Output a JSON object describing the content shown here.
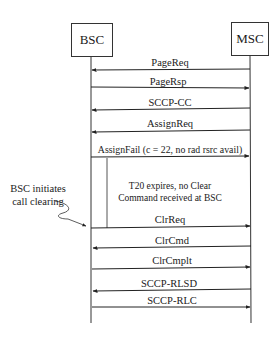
{
  "diagram": {
    "type": "sequence",
    "participants": [
      {
        "id": "bsc",
        "label": "BSC"
      },
      {
        "id": "msc",
        "label": "MSC"
      }
    ],
    "messages": [
      {
        "label": "PageReq",
        "from": "MSC",
        "to": "BSC"
      },
      {
        "label": "PageRsp",
        "from": "BSC",
        "to": "MSC"
      },
      {
        "label": "SCCP-CC",
        "from": "MSC",
        "to": "BSC"
      },
      {
        "label": "AssignReq",
        "from": "MSC",
        "to": "BSC"
      },
      {
        "label": "AssignFail (c = 22, no rad rsrc avail)",
        "from": "BSC",
        "to": "MSC"
      },
      {
        "label": "ClrReq",
        "from": "BSC",
        "to": "MSC"
      },
      {
        "label": "ClrCmd",
        "from": "MSC",
        "to": "BSC"
      },
      {
        "label": "ClrCmplt",
        "from": "BSC",
        "to": "MSC"
      },
      {
        "label": "SCCP-RLSD",
        "from": "MSC",
        "to": "BSC"
      },
      {
        "label": "SCCP-RLC",
        "from": "BSC",
        "to": "MSC"
      }
    ],
    "timer_note": {
      "line1": "T20 expires, no Clear",
      "line2": "Command received at BSC"
    },
    "side_annotation": {
      "line1": "BSC initiates",
      "line2": "call clearing"
    }
  }
}
